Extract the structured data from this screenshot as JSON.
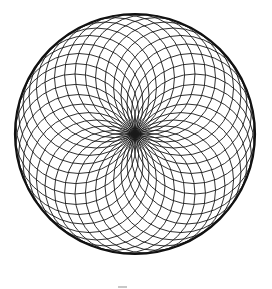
{
  "figure": {
    "type": "circle-rosette",
    "center": [
      135,
      134
    ],
    "circle_count": 36,
    "inner_circle_radius": 60,
    "outer_boundary_radius": 120,
    "stroke_color": "#1a1a1a",
    "outer_stroke_color": "#111111",
    "background": "#ffffff"
  }
}
